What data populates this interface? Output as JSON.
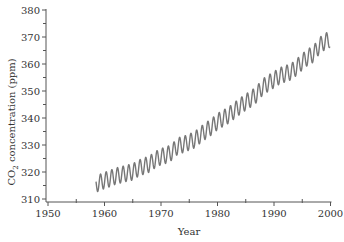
{
  "chart_data": {
    "type": "line",
    "title": "",
    "xlabel": "Year",
    "ylabel": "CO2 concentration (ppm)",
    "ylabel_parts": {
      "prefix": "CO",
      "subscript": "2",
      "suffix": " concentration (ppm)"
    },
    "xlim": [
      1950,
      2000
    ],
    "ylim": [
      310,
      380
    ],
    "x_ticks_major": [
      1950,
      1960,
      1970,
      1980,
      1990,
      2000
    ],
    "x_ticks_minor": [
      1955,
      1965,
      1975,
      1985,
      1995
    ],
    "y_ticks_major": [
      310,
      320,
      330,
      340,
      350,
      360,
      370,
      380
    ],
    "y_ticks_minor": [
      315,
      325,
      335,
      345,
      355,
      365,
      375
    ],
    "grid": false,
    "legend": null,
    "line_color": "#777777",
    "axis_color": "#555555",
    "seasonal_amplitude_ppm": 3.0,
    "series": [
      {
        "name": "Monthly CO2 (Mauna Loa, seasonal cycle)",
        "x": [
          1958.5,
          1959,
          1960,
          1961,
          1962,
          1963,
          1964,
          1965,
          1966,
          1967,
          1968,
          1969,
          1970,
          1971,
          1972,
          1973,
          1974,
          1975,
          1976,
          1977,
          1978,
          1979,
          1980,
          1981,
          1982,
          1983,
          1984,
          1985,
          1986,
          1987,
          1988,
          1989,
          1990,
          1991,
          1992,
          1993,
          1994,
          1995,
          1996,
          1997,
          1998,
          1999,
          1999.9
        ],
        "values": [
          315.5,
          316.0,
          316.9,
          317.6,
          318.5,
          319.0,
          319.6,
          320.0,
          321.4,
          322.2,
          323.0,
          324.6,
          325.7,
          326.3,
          327.5,
          329.7,
          330.2,
          331.1,
          332.0,
          333.8,
          335.4,
          336.8,
          338.7,
          339.9,
          341.1,
          342.8,
          344.4,
          345.9,
          347.2,
          348.9,
          351.5,
          352.9,
          354.2,
          355.6,
          356.4,
          357.1,
          358.8,
          360.8,
          362.6,
          363.7,
          366.7,
          368.3,
          369.2
        ]
      }
    ]
  },
  "layout": {
    "plot_left_px": 48,
    "x0_year": 1950,
    "px_per_year": 5.65,
    "y0_ppm": 310,
    "y0_px": 199,
    "px_per_ppm": 2.7,
    "axis_x_px": 46,
    "axis_y_px": 202
  }
}
